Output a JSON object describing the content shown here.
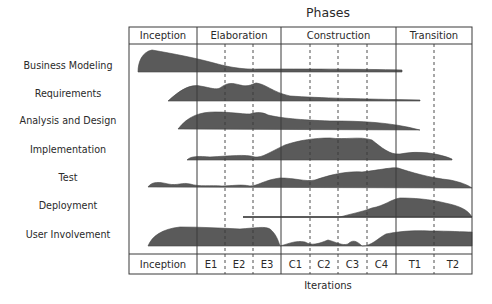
{
  "title": "Phases",
  "x_axis_label": "Iterations",
  "colors": {
    "fill": "#5a5a5a",
    "lines": "#3a3a3a",
    "text": "#2a2a2a"
  },
  "phases": [
    {
      "label": "Inception",
      "x0": 129,
      "x1": 197
    },
    {
      "label": "Elaboration",
      "x0": 197,
      "x1": 281
    },
    {
      "label": "Construction",
      "x0": 281,
      "x1": 396
    },
    {
      "label": "Transition",
      "x0": 396,
      "x1": 472
    }
  ],
  "iterations": [
    {
      "label": "Inception",
      "x0": 129,
      "x1": 197
    },
    {
      "label": "E1",
      "x0": 197,
      "x1": 225
    },
    {
      "label": "E2",
      "x0": 225,
      "x1": 253
    },
    {
      "label": "E3",
      "x0": 253,
      "x1": 281
    },
    {
      "label": "C1",
      "x0": 281,
      "x1": 310
    },
    {
      "label": "C2",
      "x0": 310,
      "x1": 338
    },
    {
      "label": "C3",
      "x0": 338,
      "x1": 367
    },
    {
      "label": "C4",
      "x0": 367,
      "x1": 396
    },
    {
      "label": "T1",
      "x0": 396,
      "x1": 434
    },
    {
      "label": "T2",
      "x0": 434,
      "x1": 472
    }
  ],
  "disciplines": [
    {
      "label": "Business Modeling",
      "y": 67
    },
    {
      "label": "Requirements",
      "y": 95
    },
    {
      "label": "Analysis and Design",
      "y": 122
    },
    {
      "label": "Implementation",
      "y": 151
    },
    {
      "label": "Test",
      "y": 179
    },
    {
      "label": "Deployment",
      "y": 207
    },
    {
      "label": "User Involvement",
      "y": 236
    }
  ]
}
